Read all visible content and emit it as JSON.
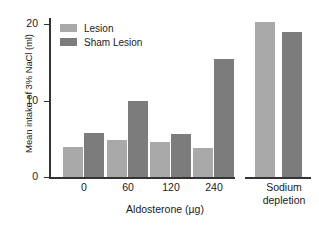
{
  "chart_data": {
    "type": "bar",
    "title": "",
    "xlabel": "Aldosterone (µg)",
    "ylabel": "Mean intake of 3% NaCl (ml)",
    "categories": [
      "0",
      "60",
      "120",
      "240",
      "Sodium depletion"
    ],
    "series": [
      {
        "name": "Lesion",
        "color": "#a9a9a9",
        "values": [
          3.8,
          4.7,
          4.4,
          3.6,
          19.5
        ]
      },
      {
        "name": "Sham Lesion",
        "color": "#7c7c7c",
        "values": [
          5.5,
          9.5,
          5.4,
          14.9,
          18.3
        ]
      }
    ],
    "ylim": [
      0,
      20
    ],
    "yticks": [
      "0",
      "10",
      "20"
    ],
    "grid": false,
    "legend_position": "top-left",
    "axis_break_between_groups": true
  },
  "axis": {
    "ylabel": "Mean intake of 3% NaCl (ml)",
    "xlabel": "Aldosterone (µg)",
    "ytick_20": "20",
    "ytick_10": "10",
    "ytick_0": "0",
    "xtick_0": "0",
    "xtick_60": "60",
    "xtick_120": "120",
    "xtick_240": "240",
    "group_sodium_line1": "Sodium",
    "group_sodium_line2": "depletion"
  },
  "legend": {
    "items": [
      {
        "label": "Lesion",
        "color": "#a9a9a9"
      },
      {
        "label": "Sham Lesion",
        "color": "#7c7c7c"
      }
    ]
  }
}
